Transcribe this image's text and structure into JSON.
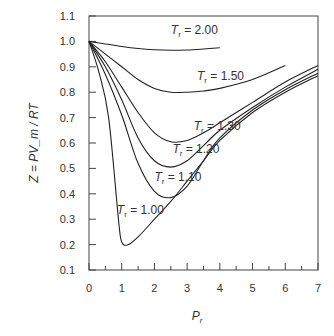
{
  "chart_data": {
    "type": "line",
    "title": "",
    "xlabel": "P",
    "xlabel_sub": "r",
    "ylabel": "Z = PV_m / RT",
    "xlim": [
      0,
      7
    ],
    "ylim": [
      0.1,
      1.1
    ],
    "xticks": [
      "0",
      "1",
      "2",
      "3",
      "4",
      "5",
      "6",
      "7"
    ],
    "yticks": [
      "0.1",
      "0.2",
      "0.3",
      "0.4",
      "0.5",
      "0.6",
      "0.7",
      "0.8",
      "0.9",
      "1.0",
      "1.1"
    ],
    "grid": false,
    "series": [
      {
        "name": "Tr = 2.00",
        "label": "= 2.00",
        "x": [
          0,
          0.5,
          1,
          1.5,
          2,
          2.5,
          3,
          3.5,
          4
        ],
        "y": [
          1.0,
          0.99,
          0.98,
          0.972,
          0.967,
          0.965,
          0.966,
          0.97,
          0.975
        ]
      },
      {
        "name": "Tr = 1.50",
        "label": "= 1.50",
        "x": [
          0,
          0.5,
          1,
          1.5,
          2,
          2.5,
          3,
          3.5,
          4,
          5,
          6
        ],
        "y": [
          1.0,
          0.95,
          0.9,
          0.85,
          0.815,
          0.8,
          0.8,
          0.805,
          0.815,
          0.85,
          0.905
        ]
      },
      {
        "name": "Tr = 1.30",
        "label": "= 1.30",
        "x": [
          0,
          0.5,
          1,
          1.5,
          2,
          2.5,
          3,
          3.5,
          4,
          5,
          6,
          7
        ],
        "y": [
          1.0,
          0.92,
          0.82,
          0.72,
          0.64,
          0.605,
          0.61,
          0.64,
          0.68,
          0.76,
          0.84,
          0.905
        ]
      },
      {
        "name": "Tr = 1.20",
        "label": "= 1.20",
        "x": [
          0,
          0.5,
          1,
          1.5,
          2,
          2.5,
          3,
          3.5,
          4,
          5,
          6,
          7
        ],
        "y": [
          1.0,
          0.9,
          0.77,
          0.62,
          0.53,
          0.505,
          0.53,
          0.59,
          0.65,
          0.74,
          0.82,
          0.89
        ]
      },
      {
        "name": "Tr = 1.10",
        "label": "= 1.10",
        "x": [
          0,
          0.5,
          1,
          1.5,
          2,
          2.5,
          3,
          3.5,
          4,
          5,
          6,
          7
        ],
        "y": [
          1.0,
          0.87,
          0.71,
          0.52,
          0.41,
          0.385,
          0.43,
          0.53,
          0.62,
          0.73,
          0.81,
          0.875
        ]
      },
      {
        "name": "Tr = 1.00",
        "label": "= 1.00",
        "x": [
          0,
          0.3,
          0.6,
          0.9,
          1.0,
          1.2,
          1.5,
          2,
          2.5,
          3,
          3.5,
          4,
          5,
          6,
          7
        ],
        "y": [
          1.0,
          0.88,
          0.7,
          0.3,
          0.21,
          0.2,
          0.23,
          0.3,
          0.37,
          0.45,
          0.53,
          0.61,
          0.72,
          0.8,
          0.865
        ]
      }
    ]
  }
}
